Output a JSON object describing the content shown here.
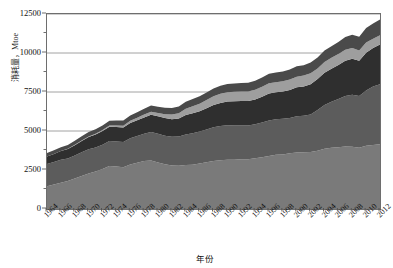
{
  "chart_data": {
    "type": "area",
    "stacked": true,
    "title": "",
    "xlabel": "年份",
    "ylabel": "消耗量，Mtoe",
    "ylim": [
      0,
      12500
    ],
    "yticks": [
      0,
      2500,
      5000,
      7500,
      10000,
      12500
    ],
    "ytick_labels": [
      "0",
      "2500",
      "5000",
      "7500",
      "10000",
      "12500"
    ],
    "yminor_step": 1250,
    "grid": true,
    "grid_axis": "y",
    "legend": "none",
    "xlim": [
      1964,
      2012
    ],
    "x": [
      1964,
      1965,
      1966,
      1967,
      1968,
      1969,
      1970,
      1971,
      1972,
      1973,
      1974,
      1975,
      1976,
      1977,
      1978,
      1979,
      1980,
      1981,
      1982,
      1983,
      1984,
      1985,
      1986,
      1987,
      1988,
      1989,
      1990,
      1991,
      1992,
      1993,
      1994,
      1995,
      1996,
      1997,
      1998,
      1999,
      2000,
      2001,
      2002,
      2003,
      2004,
      2005,
      2006,
      2007,
      2008,
      2009,
      2010,
      2011,
      2012
    ],
    "xtick_labels": [
      "1964",
      "1966",
      "1968",
      "1970",
      "1972",
      "1974",
      "1976",
      "1978",
      "1980",
      "1982",
      "1984",
      "1986",
      "1988",
      "1990",
      "1992",
      "1994",
      "1996",
      "1998",
      "2000",
      "2002",
      "2004",
      "2006",
      "2008",
      "2010",
      "2012"
    ],
    "series": [
      {
        "name": "石油",
        "color": "#7a7a7a",
        "values": [
          1460,
          1570,
          1690,
          1800,
          1950,
          2110,
          2280,
          2400,
          2560,
          2760,
          2720,
          2680,
          2860,
          2960,
          3070,
          3110,
          2980,
          2870,
          2790,
          2770,
          2820,
          2830,
          2920,
          2990,
          3070,
          3120,
          3150,
          3150,
          3190,
          3190,
          3260,
          3320,
          3400,
          3470,
          3500,
          3570,
          3620,
          3640,
          3660,
          3730,
          3870,
          3930,
          3960,
          4000,
          3990,
          3930,
          4060,
          4100,
          4150
        ]
      },
      {
        "name": "煤炭",
        "color": "#5c5c5c",
        "values": [
          1420,
          1440,
          1460,
          1440,
          1480,
          1530,
          1550,
          1540,
          1560,
          1600,
          1610,
          1620,
          1680,
          1720,
          1750,
          1820,
          1840,
          1830,
          1840,
          1880,
          1960,
          2020,
          2050,
          2110,
          2170,
          2200,
          2220,
          2200,
          2170,
          2160,
          2170,
          2230,
          2280,
          2290,
          2280,
          2270,
          2320,
          2340,
          2400,
          2610,
          2790,
          2940,
          3090,
          3250,
          3340,
          3320,
          3540,
          3750,
          3850
        ]
      },
      {
        "name": "天然气",
        "color": "#2f2f2f",
        "values": [
          480,
          510,
          560,
          600,
          660,
          720,
          780,
          830,
          880,
          920,
          930,
          930,
          980,
          1010,
          1050,
          1110,
          1120,
          1130,
          1130,
          1150,
          1240,
          1280,
          1290,
          1360,
          1420,
          1480,
          1520,
          1550,
          1560,
          1570,
          1590,
          1650,
          1720,
          1720,
          1750,
          1790,
          1860,
          1880,
          1940,
          2000,
          2070,
          2120,
          2180,
          2260,
          2300,
          2250,
          2420,
          2470,
          2550
        ]
      },
      {
        "name": "核能",
        "color": "#9e9e9e",
        "values": [
          10,
          12,
          15,
          20,
          25,
          30,
          40,
          50,
          60,
          70,
          90,
          110,
          130,
          160,
          190,
          200,
          220,
          250,
          290,
          330,
          400,
          450,
          480,
          520,
          560,
          580,
          590,
          610,
          610,
          620,
          630,
          640,
          660,
          650,
          660,
          670,
          680,
          690,
          700,
          670,
          700,
          700,
          700,
          700,
          690,
          660,
          660,
          600,
          580
        ]
      },
      {
        "name": "水电及可再生能源",
        "color": "#4a4a4a",
        "values": [
          220,
          230,
          240,
          250,
          260,
          270,
          280,
          290,
          300,
          310,
          320,
          330,
          340,
          350,
          370,
          390,
          400,
          410,
          420,
          440,
          460,
          470,
          480,
          490,
          510,
          520,
          530,
          540,
          550,
          560,
          570,
          590,
          610,
          620,
          630,
          650,
          670,
          670,
          690,
          700,
          730,
          750,
          780,
          810,
          850,
          880,
          930,
          970,
          1020
        ]
      }
    ],
    "totals_note": "堆积面积图（1964–2012 世界一次能源消费）"
  }
}
